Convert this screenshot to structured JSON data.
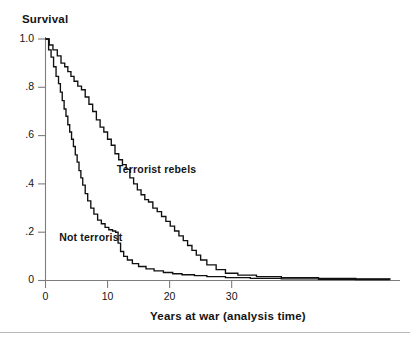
{
  "chart_data": {
    "type": "line",
    "subtype": "kaplan-meier-step",
    "title": "Survival",
    "xlabel": "Years at war (analysis time)",
    "ylabel": "Survival",
    "xlim": [
      0,
      56
    ],
    "ylim": [
      0,
      1.0
    ],
    "grid": false,
    "legend": "inline-annotations",
    "xticks": [
      0,
      10,
      20,
      30
    ],
    "xticklabels": [
      "0",
      "10",
      "20",
      "30"
    ],
    "yticks": [
      0,
      0.2,
      0.4,
      0.6,
      0.8,
      1.0
    ],
    "yticklabels": [
      "0",
      ".2",
      ".4",
      ".6",
      ".8",
      "1.0"
    ],
    "series": [
      {
        "name": "Not terrorist",
        "label": "Not terrorist",
        "color": "#101010",
        "annotation_x": 2.2,
        "annotation_y": 0.175,
        "x": [
          0,
          0.5,
          0.9,
          1.3,
          1.7,
          2.1,
          2.4,
          2.7,
          3.0,
          3.3,
          3.6,
          3.9,
          4.2,
          4.5,
          4.8,
          5.1,
          5.4,
          5.7,
          6.0,
          6.4,
          6.8,
          7.3,
          7.8,
          8.4,
          9.0,
          9.6,
          10.2,
          10.8,
          11.3,
          11.7,
          12.1,
          12.6,
          13.2,
          14.0,
          15.0,
          16.2,
          17.5,
          19.0,
          20.5,
          22.0,
          24.0,
          26.0,
          29.0,
          33.0,
          38.0,
          44.0,
          50.0,
          55.5
        ],
        "y": [
          1.0,
          0.955,
          0.925,
          0.885,
          0.845,
          0.815,
          0.78,
          0.745,
          0.71,
          0.68,
          0.645,
          0.615,
          0.585,
          0.555,
          0.52,
          0.49,
          0.455,
          0.425,
          0.395,
          0.36,
          0.33,
          0.3,
          0.275,
          0.25,
          0.235,
          0.22,
          0.21,
          0.205,
          0.2,
          0.155,
          0.12,
          0.1,
          0.085,
          0.07,
          0.058,
          0.048,
          0.04,
          0.033,
          0.028,
          0.024,
          0.02,
          0.016,
          0.012,
          0.009,
          0.007,
          0.005,
          0.004,
          0.003
        ]
      },
      {
        "name": "Terrorist rebels",
        "label": "Terrorist rebels",
        "color": "#101010",
        "annotation_x": 11.5,
        "annotation_y": 0.455,
        "x": [
          0,
          0.6,
          1.2,
          1.9,
          2.5,
          3.1,
          3.6,
          4.1,
          4.6,
          5.2,
          5.8,
          6.4,
          7.0,
          7.6,
          8.2,
          8.8,
          9.4,
          10.0,
          10.6,
          11.2,
          11.8,
          12.4,
          13.0,
          13.6,
          14.2,
          14.8,
          15.4,
          16.0,
          16.6,
          17.3,
          18.0,
          18.7,
          19.4,
          20.1,
          20.8,
          21.5,
          22.2,
          22.9,
          23.6,
          24.3,
          25.0,
          26.0,
          27.5,
          29.0,
          31.0,
          34.0,
          38.0,
          44.0,
          50.0,
          55.5
        ],
        "y": [
          1.0,
          0.975,
          0.955,
          0.93,
          0.9,
          0.885,
          0.865,
          0.845,
          0.825,
          0.805,
          0.79,
          0.76,
          0.73,
          0.7,
          0.665,
          0.635,
          0.615,
          0.585,
          0.56,
          0.525,
          0.5,
          0.48,
          0.46,
          0.425,
          0.4,
          0.375,
          0.355,
          0.335,
          0.325,
          0.3,
          0.285,
          0.265,
          0.245,
          0.225,
          0.205,
          0.185,
          0.165,
          0.145,
          0.125,
          0.105,
          0.085,
          0.065,
          0.045,
          0.03,
          0.022,
          0.016,
          0.012,
          0.009,
          0.007,
          0.006
        ]
      }
    ]
  },
  "axes": {
    "title_text": "Survival",
    "xaxis_title": "Years at war (analysis time)"
  }
}
